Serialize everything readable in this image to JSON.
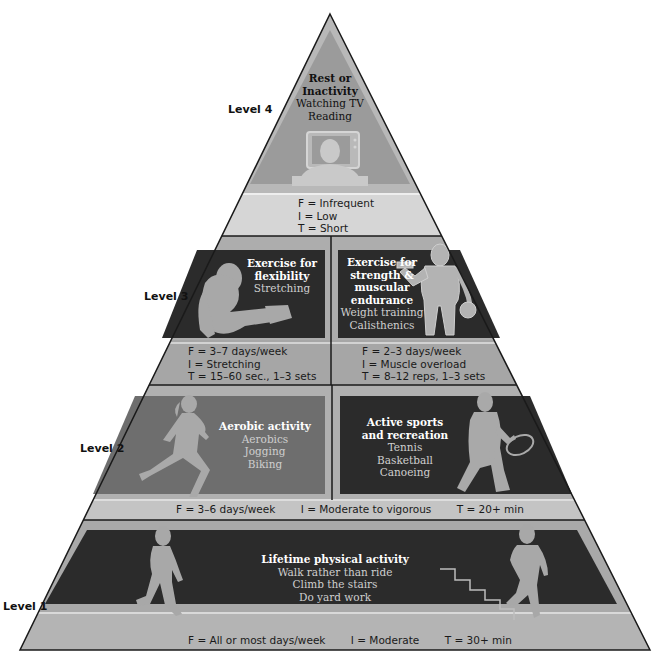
{
  "diagram": {
    "type": "physical-activity-pyramid",
    "colors": {
      "outline": "#1a1a1a",
      "band_light": "#c8c8c8",
      "band_mid": "#a9a9a9",
      "panel_dark": "#2b2b2b",
      "panel_medium": "#6e6e6e",
      "panel_level4": "#9b9b9b",
      "silhouette": "#a8a8a8",
      "text_white": "#ffffff",
      "text_light": "#d0d0d0"
    }
  },
  "levels": {
    "level4": {
      "label": "Level 4",
      "title_line1": "Rest or",
      "title_line2": "Inactivity",
      "items": [
        "Watching TV",
        "Reading"
      ],
      "fit": [
        "F = Infrequent",
        "I = Low",
        "T = Short"
      ]
    },
    "level3": {
      "label": "Level 3",
      "left": {
        "title_line1": "Exercise for",
        "title_line2": "flexibility",
        "items": [
          "Stretching"
        ],
        "fit": [
          "F = 3–7 days/week",
          "I = Stretching",
          "T = 15–60 sec., 1–3 sets"
        ]
      },
      "right": {
        "title_line1": "Exercise for",
        "title_line2": "strength &",
        "title_line3": "muscular",
        "title_line4": "endurance",
        "items": [
          "Weight training",
          "Calisthenics"
        ],
        "fit": [
          "F = 2–3 days/week",
          "I = Muscle overload",
          "T = 8–12 reps, 1–3 sets"
        ]
      }
    },
    "level2": {
      "label": "Level 2",
      "left": {
        "title": "Aerobic activity",
        "items": [
          "Aerobics",
          "Jogging",
          "Biking"
        ]
      },
      "right": {
        "title_line1": "Active sports",
        "title_line2": "and recreation",
        "items": [
          "Tennis",
          "Basketball",
          "Canoeing"
        ]
      },
      "fit": [
        "F = 3–6 days/week",
        "I = Moderate to vigorous",
        "T = 20+ min"
      ]
    },
    "level1": {
      "label": "Level 1",
      "title": "Lifetime physical activity",
      "items": [
        "Walk rather than ride",
        "Climb the stairs",
        "Do yard work"
      ],
      "fit": [
        "F = All or most days/week",
        "I = Moderate",
        "T = 30+ min"
      ]
    }
  },
  "icons": {
    "level4": "person-watching-tv-icon",
    "level3_left": "person-stretching-icon",
    "level3_right": "person-lifting-dumbbell-icon",
    "level2_left": "woman-running-icon",
    "level2_right": "tennis-player-icon",
    "level1_left": "person-walking-icon",
    "level1_right": "person-climbing-stairs-icon"
  }
}
